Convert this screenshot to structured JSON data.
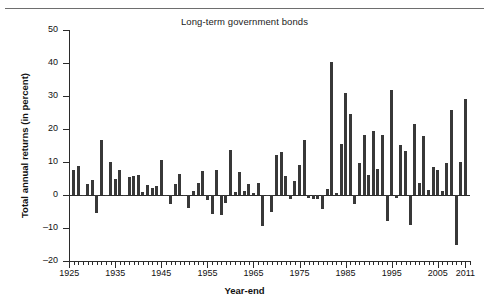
{
  "figure": {
    "title": "Long-term government bonds",
    "xlabel": "Year-end",
    "ylabel": "Total annual returns (in percent)",
    "bar_color": "#383838",
    "axis_color": "#2b2b2b",
    "rule_color": "#6e6e6e"
  },
  "chart_data": {
    "type": "bar",
    "title": "Long-term government bonds",
    "xlabel": "Year-end",
    "ylabel": "Total annual returns (in percent)",
    "xlim": [
      1925,
      2012
    ],
    "ylim": [
      -20,
      50
    ],
    "ytick_values": [
      -20,
      -10,
      0,
      10,
      20,
      30,
      40,
      50
    ],
    "ytick_labels": [
      "–20",
      "–10",
      "0",
      "10",
      "20",
      "30",
      "40",
      "50"
    ],
    "xtick_values": [
      1925,
      1935,
      1945,
      1955,
      1965,
      1975,
      1985,
      1995,
      2005,
      2011
    ],
    "xtick_labels": [
      "1925",
      "1935",
      "1945",
      "1955",
      "1965",
      "1975",
      "1985",
      "1995",
      "2005",
      "2011"
    ],
    "grid": false,
    "legend": null,
    "x": [
      1926,
      1927,
      1928,
      1929,
      1930,
      1931,
      1932,
      1933,
      1934,
      1935,
      1936,
      1937,
      1938,
      1939,
      1940,
      1941,
      1942,
      1943,
      1944,
      1945,
      1946,
      1947,
      1948,
      1949,
      1950,
      1951,
      1952,
      1953,
      1954,
      1955,
      1956,
      1957,
      1958,
      1959,
      1960,
      1961,
      1962,
      1963,
      1964,
      1965,
      1966,
      1967,
      1968,
      1969,
      1970,
      1971,
      1972,
      1973,
      1974,
      1975,
      1976,
      1977,
      1978,
      1979,
      1980,
      1981,
      1982,
      1983,
      1984,
      1985,
      1986,
      1987,
      1988,
      1989,
      1990,
      1991,
      1992,
      1993,
      1994,
      1995,
      1996,
      1997,
      1998,
      1999,
      2000,
      2001,
      2002,
      2003,
      2004,
      2005,
      2006,
      2007,
      2008,
      2009,
      2010,
      2011
    ],
    "values": [
      7.8,
      8.9,
      0.1,
      3.4,
      4.7,
      -5.3,
      16.8,
      -0.1,
      10.0,
      5.0,
      7.5,
      0.2,
      5.5,
      5.9,
      6.1,
      0.9,
      3.2,
      2.1,
      2.8,
      10.7,
      -0.1,
      -2.6,
      3.4,
      6.5,
      0.1,
      -3.9,
      1.2,
      3.6,
      7.2,
      -1.3,
      -5.6,
      7.5,
      -6.1,
      -2.3,
      13.8,
      1.0,
      6.9,
      1.2,
      3.5,
      0.7,
      3.6,
      -9.2,
      -0.3,
      -5.1,
      12.1,
      13.2,
      5.7,
      -1.1,
      4.4,
      9.2,
      16.8,
      -0.7,
      -1.2,
      -1.2,
      -4.0,
      1.9,
      40.4,
      0.7,
      15.5,
      31.0,
      24.5,
      -2.7,
      9.7,
      18.1,
      6.2,
      19.3,
      8.1,
      18.2,
      -7.8,
      31.7,
      -0.9,
      15.1,
      13.5,
      -9.0,
      21.5,
      3.7,
      17.8,
      1.5,
      8.5,
      7.8,
      1.2,
      9.9,
      25.9,
      -14.9,
      10.1,
      29.0
    ]
  }
}
